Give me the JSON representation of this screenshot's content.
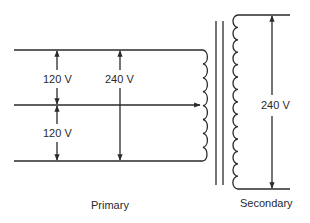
{
  "diagram": {
    "labels": {
      "primary_upper_voltage": "120 V",
      "primary_lower_voltage": "120 V",
      "primary_total_voltage": "240 V",
      "secondary_voltage": "240 V",
      "primary_caption": "Primary",
      "secondary_caption": "Secondary"
    },
    "components": {
      "primary_coil_turns": 8,
      "secondary_coil_turns": 14,
      "core_lines": 2,
      "center_tap": true
    },
    "colors": {
      "line": "#2a2a2a",
      "background": "#ffffff"
    }
  }
}
